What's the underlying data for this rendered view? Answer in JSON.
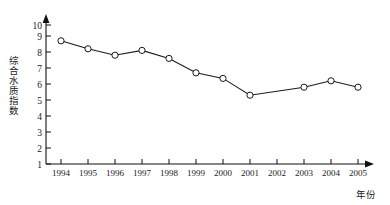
{
  "chart_data": {
    "type": "line",
    "title": "",
    "xlabel": "年份",
    "ylabel": "综合水质指数",
    "categories": [
      "1994",
      "1995",
      "1996",
      "1997",
      "1998",
      "1999",
      "2000",
      "2001",
      "2002",
      "2003",
      "2004",
      "2005"
    ],
    "values": [
      8.7,
      8.2,
      7.8,
      8.1,
      7.6,
      6.7,
      6.35,
      5.3,
      null,
      5.8,
      6.2,
      5.8
    ],
    "series": [
      {
        "name": "综合水质指数",
        "values": [
          8.7,
          8.2,
          7.8,
          8.1,
          7.6,
          6.7,
          6.35,
          5.3,
          null,
          5.8,
          6.2,
          5.8
        ]
      }
    ],
    "ylim": [
      1,
      10
    ],
    "yticks": [
      "1",
      "2",
      "3",
      "4",
      "5",
      "6",
      "7",
      "8",
      "9",
      "10"
    ],
    "xticks": [
      "1994",
      "1995",
      "1996",
      "1997",
      "1998",
      "1999",
      "2000",
      "2001",
      "2002",
      "2003",
      "2004",
      "2005"
    ],
    "grid": false,
    "legend": "none",
    "marker": "open-circle",
    "line_color": "#1a1a1a",
    "marker_fill": "#ffffff",
    "background": "#ffffff"
  }
}
